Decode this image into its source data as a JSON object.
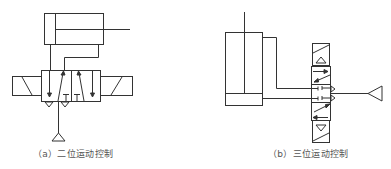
{
  "diagram": {
    "line_color": "#333333",
    "panels": [
      {
        "id": "a",
        "caption": "（a）二位运动控制",
        "components": [
          "double-acting-cylinder",
          "5/2-way-solenoid-valve",
          "pressure-source"
        ]
      },
      {
        "id": "b",
        "caption": "（b）三位运动控制",
        "components": [
          "double-acting-cylinder",
          "5/3-way-solenoid-valve",
          "pressure-source"
        ]
      }
    ]
  }
}
